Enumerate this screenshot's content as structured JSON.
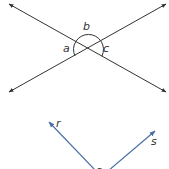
{
  "figure_top": {
    "description": "Two intersecting lines forming angles a, b, c",
    "line_color": "#333333",
    "labels": {
      "a": "a",
      "b": "b",
      "c": "c"
    }
  },
  "figure_bottom": {
    "description": "Angle formed by rays r and s from a vertex",
    "ray_color": "#4a6fa5",
    "labels": {
      "r": "r",
      "s": "s",
      "vertex": "a"
    }
  }
}
